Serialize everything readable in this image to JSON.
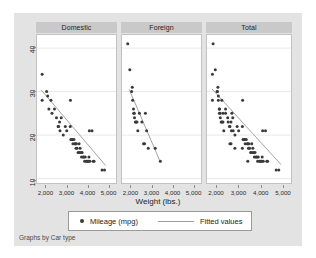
{
  "topstrip": {
    "clipped_text": ""
  },
  "footer": {
    "note": "Graphs by Car type"
  },
  "legend": {
    "marker_label": "Mileage (mpg)",
    "line_label": "Fitted values"
  },
  "colors": {
    "frame_background": "#e3e3e3",
    "plot_background": "#ffffff",
    "panel_header": "#c9c9c9",
    "marker": "#3a3a3a",
    "fit_line": "#9a9a9a",
    "gridline": "#e8e8e8",
    "axis_text": "#2b2b2b"
  },
  "chart_data": {
    "type": "scatter",
    "title": "",
    "xlabel": "Weight (lbs.)",
    "ylabel": "Mileage (mpg)",
    "xlim": [
      1550,
      5400
    ],
    "ylim": [
      9,
      43
    ],
    "xticks": [
      2000,
      3000,
      4000,
      5000
    ],
    "xticklabels": [
      "2,000",
      "3,000",
      "4,000",
      "5,000"
    ],
    "yticks": [
      10,
      20,
      30,
      40
    ],
    "yticklabels": [
      "10",
      "20",
      "30",
      "40"
    ],
    "grid": "horizontal",
    "legend_position": "bottom",
    "facet_by": "Car type",
    "panels": [
      {
        "label": "Domestic",
        "points": [
          [
            1800,
            34
          ],
          [
            1800,
            28
          ],
          [
            2020,
            30
          ],
          [
            2070,
            29
          ],
          [
            2130,
            26
          ],
          [
            2230,
            28
          ],
          [
            2280,
            25
          ],
          [
            2400,
            26
          ],
          [
            2500,
            24
          ],
          [
            2580,
            22
          ],
          [
            2600,
            22
          ],
          [
            2650,
            23
          ],
          [
            2670,
            21
          ],
          [
            2730,
            24
          ],
          [
            2830,
            20
          ],
          [
            2930,
            22
          ],
          [
            3000,
            21
          ],
          [
            3170,
            22
          ],
          [
            3180,
            28
          ],
          [
            3200,
            19
          ],
          [
            3250,
            19
          ],
          [
            3280,
            19
          ],
          [
            3300,
            18
          ],
          [
            3350,
            19
          ],
          [
            3400,
            18
          ],
          [
            3420,
            18
          ],
          [
            3450,
            17
          ],
          [
            3470,
            18
          ],
          [
            3500,
            17
          ],
          [
            3550,
            16
          ],
          [
            3600,
            18
          ],
          [
            3620,
            16
          ],
          [
            3650,
            17
          ],
          [
            3700,
            16
          ],
          [
            3720,
            15
          ],
          [
            3750,
            16
          ],
          [
            3800,
            15
          ],
          [
            3830,
            15
          ],
          [
            3870,
            14
          ],
          [
            3900,
            15
          ],
          [
            3950,
            14
          ],
          [
            4000,
            14
          ],
          [
            4030,
            14
          ],
          [
            4060,
            14
          ],
          [
            4080,
            15
          ],
          [
            4100,
            21
          ],
          [
            4130,
            14
          ],
          [
            4230,
            21
          ],
          [
            4290,
            14
          ],
          [
            4330,
            14
          ],
          [
            4720,
            12
          ],
          [
            4840,
            12
          ]
        ],
        "fit": {
          "x": [
            1750,
            4900
          ],
          "y": [
            30.4,
            13.0
          ]
        }
      },
      {
        "label": "Foreign",
        "points": [
          [
            1830,
            41
          ],
          [
            1930,
            35
          ],
          [
            2020,
            30
          ],
          [
            2050,
            31
          ],
          [
            2070,
            28
          ],
          [
            2110,
            26
          ],
          [
            2120,
            25
          ],
          [
            2150,
            25
          ],
          [
            2160,
            24
          ],
          [
            2200,
            23
          ],
          [
            2240,
            23
          ],
          [
            2280,
            23
          ],
          [
            2320,
            21
          ],
          [
            2400,
            25
          ],
          [
            2520,
            23
          ],
          [
            2600,
            18
          ],
          [
            2650,
            18
          ],
          [
            2690,
            25
          ],
          [
            2750,
            21
          ],
          [
            2830,
            17
          ],
          [
            3170,
            17
          ],
          [
            3420,
            14
          ]
        ],
        "fit": {
          "x": [
            1900,
            3420
          ],
          "y": [
            30.5,
            13.8
          ]
        }
      },
      {
        "label": "Total",
        "points": [
          [
            1800,
            34
          ],
          [
            1800,
            28
          ],
          [
            1830,
            41
          ],
          [
            1930,
            35
          ],
          [
            2020,
            30
          ],
          [
            2020,
            30
          ],
          [
            2050,
            31
          ],
          [
            2070,
            29
          ],
          [
            2070,
            28
          ],
          [
            2110,
            26
          ],
          [
            2120,
            25
          ],
          [
            2130,
            26
          ],
          [
            2150,
            25
          ],
          [
            2160,
            24
          ],
          [
            2200,
            23
          ],
          [
            2230,
            28
          ],
          [
            2240,
            23
          ],
          [
            2280,
            25
          ],
          [
            2280,
            23
          ],
          [
            2320,
            21
          ],
          [
            2400,
            26
          ],
          [
            2400,
            25
          ],
          [
            2500,
            24
          ],
          [
            2520,
            23
          ],
          [
            2580,
            22
          ],
          [
            2600,
            22
          ],
          [
            2600,
            18
          ],
          [
            2650,
            23
          ],
          [
            2650,
            18
          ],
          [
            2670,
            21
          ],
          [
            2690,
            25
          ],
          [
            2730,
            24
          ],
          [
            2750,
            21
          ],
          [
            2830,
            20
          ],
          [
            2830,
            17
          ],
          [
            2930,
            22
          ],
          [
            3000,
            21
          ],
          [
            3170,
            22
          ],
          [
            3170,
            17
          ],
          [
            3180,
            28
          ],
          [
            3200,
            19
          ],
          [
            3250,
            19
          ],
          [
            3280,
            19
          ],
          [
            3300,
            18
          ],
          [
            3350,
            19
          ],
          [
            3400,
            18
          ],
          [
            3420,
            18
          ],
          [
            3420,
            14
          ],
          [
            3450,
            17
          ],
          [
            3470,
            18
          ],
          [
            3500,
            17
          ],
          [
            3550,
            16
          ],
          [
            3600,
            18
          ],
          [
            3620,
            16
          ],
          [
            3650,
            17
          ],
          [
            3700,
            16
          ],
          [
            3720,
            15
          ],
          [
            3750,
            16
          ],
          [
            3800,
            15
          ],
          [
            3830,
            15
          ],
          [
            3870,
            14
          ],
          [
            3900,
            15
          ],
          [
            3950,
            14
          ],
          [
            4000,
            14
          ],
          [
            4030,
            14
          ],
          [
            4060,
            14
          ],
          [
            4080,
            15
          ],
          [
            4100,
            21
          ],
          [
            4130,
            14
          ],
          [
            4230,
            21
          ],
          [
            4290,
            14
          ],
          [
            4330,
            14
          ],
          [
            4720,
            12
          ],
          [
            4840,
            12
          ]
        ],
        "fit": {
          "x": [
            1780,
            4950
          ],
          "y": [
            30.6,
            13.2
          ]
        }
      }
    ]
  }
}
